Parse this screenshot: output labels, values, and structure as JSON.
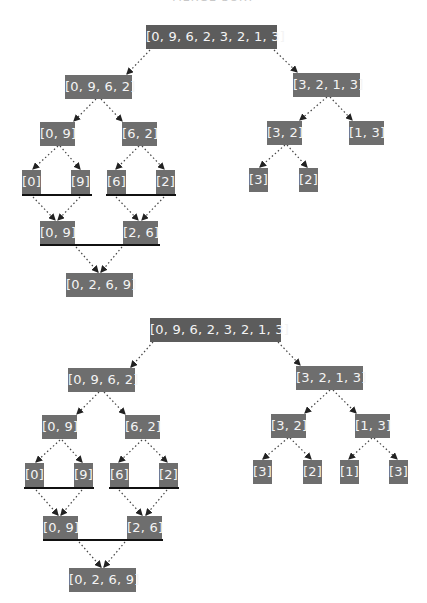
{
  "title": "MERGE SORT",
  "colors": {
    "node": "#6e6e6e",
    "root_node": "#5c5c5c",
    "node_text": "#f4f4f4",
    "merge_bar": "#111111",
    "edge": "#333333"
  },
  "diagrams": [
    {
      "name": "merge-sort-partial",
      "root": "[0, 9, 6, 2, 3, 2, 1, 3]",
      "split_level1": [
        "[0, 9, 6, 2]",
        "[3, 2, 1, 3]"
      ],
      "split_level2": [
        "[0, 9]",
        "[6, 2]",
        "[3, 2]",
        "[1, 3]"
      ],
      "split_level3": [
        "[0]",
        "[9]",
        "[6]",
        "[2]",
        "[3]",
        "[2]"
      ],
      "merge_level1": [
        "[0, 9]",
        "[2, 6]"
      ],
      "merge_level2": [
        "[0, 2, 6, 9]"
      ]
    },
    {
      "name": "merge-sort-full-split",
      "root": "[0, 9, 6, 2, 3, 2, 1, 3]",
      "split_level1": [
        "[0, 9, 6, 2]",
        "[3, 2, 1, 3]"
      ],
      "split_level2": [
        "[0, 9]",
        "[6, 2]",
        "[3, 2]",
        "[1, 3]"
      ],
      "split_level3": [
        "[0]",
        "[9]",
        "[6]",
        "[2]",
        "[3]",
        "[2]",
        "[1]",
        "[3]"
      ],
      "merge_level1": [
        "[0, 9]",
        "[2, 6]"
      ],
      "merge_level2": [
        "[0, 2, 6, 9]"
      ]
    }
  ]
}
